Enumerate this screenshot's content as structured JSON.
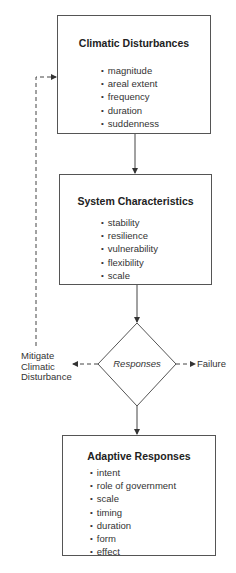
{
  "diagram": {
    "nodes": {
      "climatic_disturbances": {
        "title": "Climatic Disturbances",
        "items": [
          "magnitude",
          "areal extent",
          "frequency",
          "duration",
          "suddenness"
        ]
      },
      "system_characteristics": {
        "title": "System Characteristics",
        "items": [
          "stability",
          "resilience",
          "vulnerability",
          "flexibility",
          "scale"
        ]
      },
      "responses": {
        "label": "Responses"
      },
      "adaptive_responses": {
        "title": "Adaptive Responses",
        "items": [
          "intent",
          "role of government",
          "scale",
          "timing",
          "duration",
          "form",
          "effect"
        ]
      }
    },
    "outcomes": {
      "mitigate": "Mitigate Climatic Disturbance",
      "mitigate_lines": [
        "Mitigate",
        "Climatic",
        "Disturbance"
      ],
      "failure": "Failure"
    },
    "edges": [
      {
        "from": "Climatic Disturbances",
        "to": "System Characteristics",
        "style": "solid"
      },
      {
        "from": "System Characteristics",
        "to": "Responses",
        "style": "solid"
      },
      {
        "from": "Responses",
        "to": "Adaptive Responses",
        "style": "solid"
      },
      {
        "from": "Responses",
        "to": "Mitigate Climatic Disturbance",
        "style": "dashed"
      },
      {
        "from": "Responses",
        "to": "Failure",
        "style": "dashed"
      },
      {
        "from": "Mitigate Climatic Disturbance",
        "to": "Climatic Disturbances",
        "style": "dashed"
      }
    ],
    "colors": {
      "line": "#444444",
      "text": "#2a2a2a",
      "background": "#ffffff"
    }
  }
}
